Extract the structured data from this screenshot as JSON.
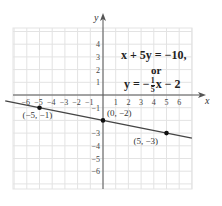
{
  "chart_data": {
    "type": "line",
    "title": "",
    "xlabel": "x",
    "ylabel": "y",
    "xlim": [
      -7,
      7
    ],
    "ylim": [
      -7.4,
      5.3
    ],
    "grid": true,
    "x_ticks": [
      "-6",
      "-5",
      "-4",
      "-3",
      "-2",
      "-1",
      "1",
      "2",
      "3",
      "4",
      "5",
      "6"
    ],
    "y_ticks": [
      "4",
      "3",
      "2",
      "1",
      "-1",
      "-3",
      "-4",
      "-5",
      "-6"
    ],
    "series": [
      {
        "name": "x + 5y = -10",
        "slope": -0.2,
        "intercept": -2,
        "x_range": [
          -7,
          7
        ]
      }
    ],
    "points": [
      {
        "x": -5,
        "y": -1,
        "label": "(−5, −1)"
      },
      {
        "x": 0,
        "y": -2,
        "label": "(0, −2)"
      },
      {
        "x": 5,
        "y": -3,
        "label": "(5, −3)"
      }
    ],
    "annotations": {
      "eq1": "x + 5y = −10,",
      "or": "or",
      "eq2_lhs": "y = −",
      "eq2_num": "1",
      "eq2_den": "5",
      "eq2_rhs": "x − 2"
    }
  }
}
